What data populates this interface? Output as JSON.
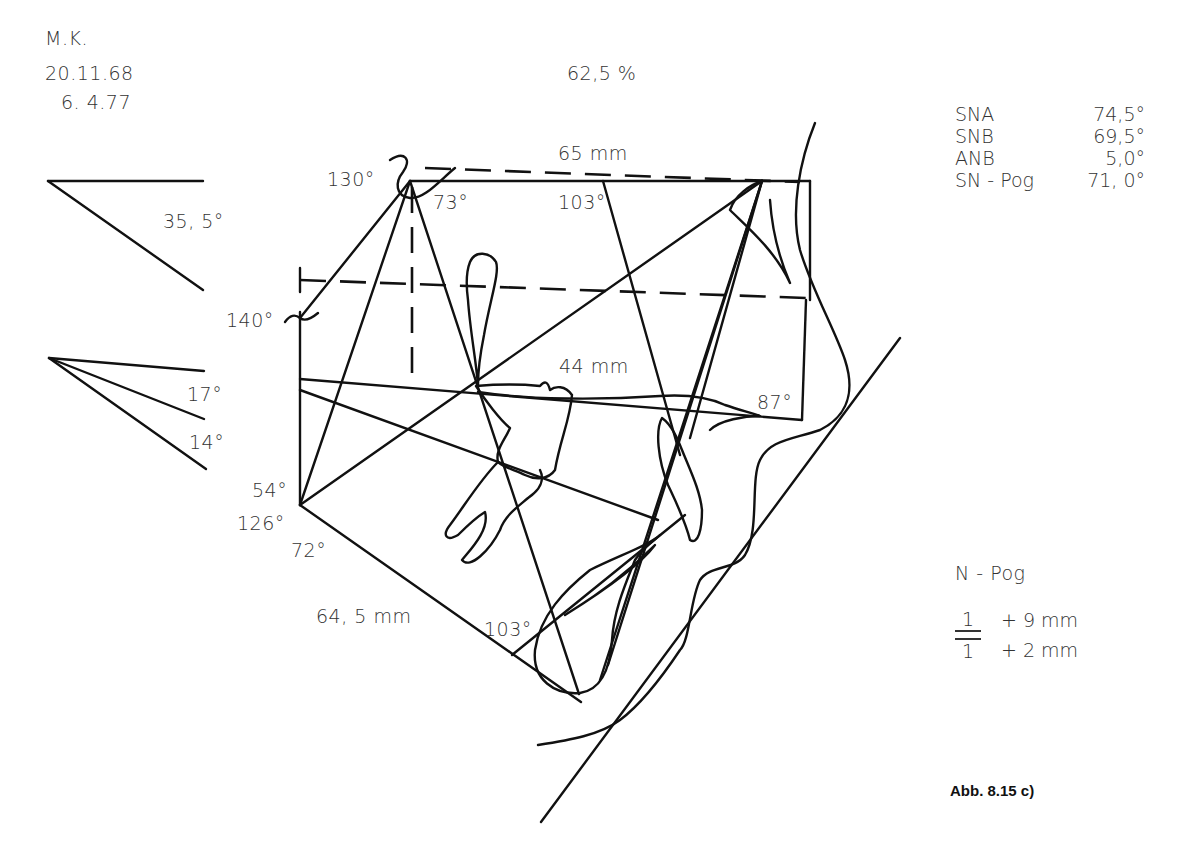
{
  "header": {
    "patient_initials": "M.K.",
    "birth_date": "20.11.68",
    "exam_date": "6. 4.77",
    "ratio": "62,5 %"
  },
  "angle_diagrams": [
    {
      "label": "35, 5°"
    },
    {
      "label": "17°"
    },
    {
      "label": "14°"
    }
  ],
  "tracing_labels": {
    "saddle_angle": "130°",
    "s_angle_inner": "73°",
    "n_angle": "103°",
    "anterior_cranial_base": "65 mm",
    "articular_angle": "140°",
    "posterior_length": "44 mm",
    "anterior_angle": "87°",
    "gonial_upper": "54°",
    "gonial_total": "126°",
    "gonial_lower": "72°",
    "mandible_length": "64, 5 mm",
    "menton_angle": "103°"
  },
  "measurements": [
    {
      "name": "SNA",
      "value": "74,5°"
    },
    {
      "name": "SNB",
      "value": "69,5°"
    },
    {
      "name": "ANB",
      "value": "5,0°"
    },
    {
      "name": "SN - Pog",
      "value": "71, 0°"
    }
  ],
  "incisor_reference": {
    "title": "N - Pog",
    "rows": [
      {
        "tooth": "1",
        "position": "upper",
        "value": "+  9 mm"
      },
      {
        "tooth": "1",
        "position": "lower",
        "value": "+  2 mm"
      }
    ]
  },
  "caption": "Abb. 8.15 c)"
}
